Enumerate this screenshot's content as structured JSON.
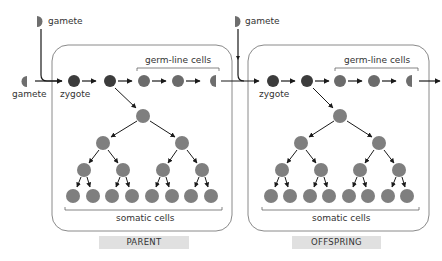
{
  "diagram": {
    "labels": {
      "gamete_top_left": "gamete",
      "gamete_left": "gamete",
      "gamete_top_right": "gamete",
      "zygote_parent": "zygote",
      "zygote_offspring": "zygote",
      "germline_parent": "germ-line cells",
      "germline_offspring": "germ-line cells",
      "somatic_parent": "somatic cells",
      "somatic_offspring": "somatic cells"
    },
    "panels": [
      {
        "name": "parent",
        "label": "PARENT"
      },
      {
        "name": "offspring",
        "label": "OFFSPRING"
      }
    ],
    "colors": {
      "zygote": "#3c3c3c",
      "germline": "#6b6b6b",
      "somatic": "#7f7f7f",
      "gamete": "#6e6e6e",
      "box_stroke": "#8a8a8a",
      "label_bar": "#e0e0e0",
      "arrow": "#1a1a1a"
    }
  }
}
